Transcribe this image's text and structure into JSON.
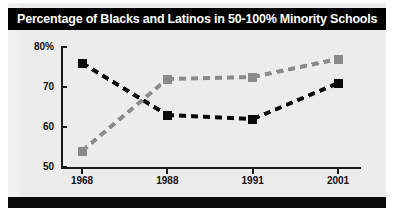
{
  "title": "Percentage of Blacks and Latinos in 50-100% Minority Schools",
  "colors": {
    "series_black": "#0a0a0a",
    "series_gray": "#8a8a8a",
    "title_bar_bg": "#000000",
    "title_text": "#ffffff",
    "card_bg": "#ececed",
    "axis": "#1a1a1a"
  },
  "chart_data": {
    "type": "line",
    "title": "Percentage of Blacks and Latinos in 50-100% Minority Schools",
    "xlabel": "",
    "ylabel": "",
    "categories": [
      "1968",
      "1988",
      "1991",
      "2001"
    ],
    "x_tick_labels": [
      "1968",
      "1988",
      "1991",
      "2001"
    ],
    "y_tick_labels": [
      "80%",
      "70",
      "60",
      "50"
    ],
    "y_tick_values": [
      80,
      70,
      60,
      50
    ],
    "ylim": [
      50,
      80
    ],
    "grid": false,
    "legend": "none",
    "line_style": "dashed",
    "marker": "square",
    "series": [
      {
        "name": "Blacks",
        "color": "#0a0a0a",
        "values": [
          76,
          63,
          62,
          71
        ]
      },
      {
        "name": "Latinos",
        "color": "#8a8a8a",
        "values": [
          54,
          72,
          72.5,
          77
        ]
      }
    ]
  }
}
